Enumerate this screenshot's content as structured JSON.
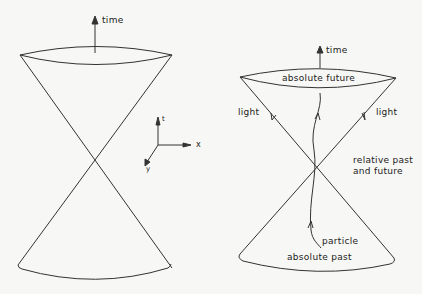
{
  "left_diagram": {
    "time_label": "time",
    "axes": {
      "t_label": "t",
      "x_label": "x",
      "y_label": "y"
    }
  },
  "right_diagram": {
    "time_label": "time",
    "absolute_future_label": "absolute future",
    "light_left_label": "light",
    "light_right_label": "light",
    "relative_label_line1": "relative past",
    "relative_label_line2": "and future",
    "particle_label": "particle",
    "absolute_past_label": "absolute past"
  },
  "colors": {
    "line": "#333333",
    "background": "#f7f7f5"
  }
}
